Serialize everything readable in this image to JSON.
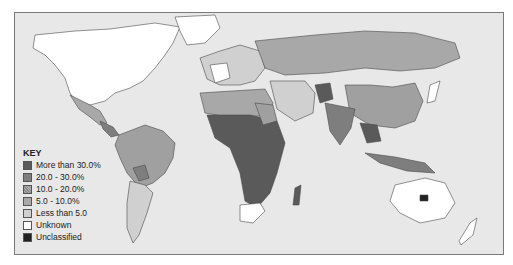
{
  "key": {
    "title": "KEY",
    "items": [
      {
        "label": "More than 30.0%",
        "color": "#5a5a5a",
        "pattern": "solid"
      },
      {
        "label": "20.0 - 30.0%",
        "color": "#7e7e7e",
        "pattern": "solid"
      },
      {
        "label": "10.0 - 20.0%",
        "color": "#a0a0a0",
        "pattern": "hatched"
      },
      {
        "label": "5.0 - 10.0%",
        "color": "#a8a8a8",
        "pattern": "solid"
      },
      {
        "label": "Less than 5.0",
        "color": "#d0d0d0",
        "pattern": "solid"
      },
      {
        "label": "Unknown",
        "color": "#ffffff",
        "pattern": "solid"
      },
      {
        "label": "Unclassified",
        "color": "#222222",
        "pattern": "solid"
      }
    ]
  },
  "colors": {
    "ocean": "#e8e8e8",
    "border": "#4a4a4a"
  }
}
